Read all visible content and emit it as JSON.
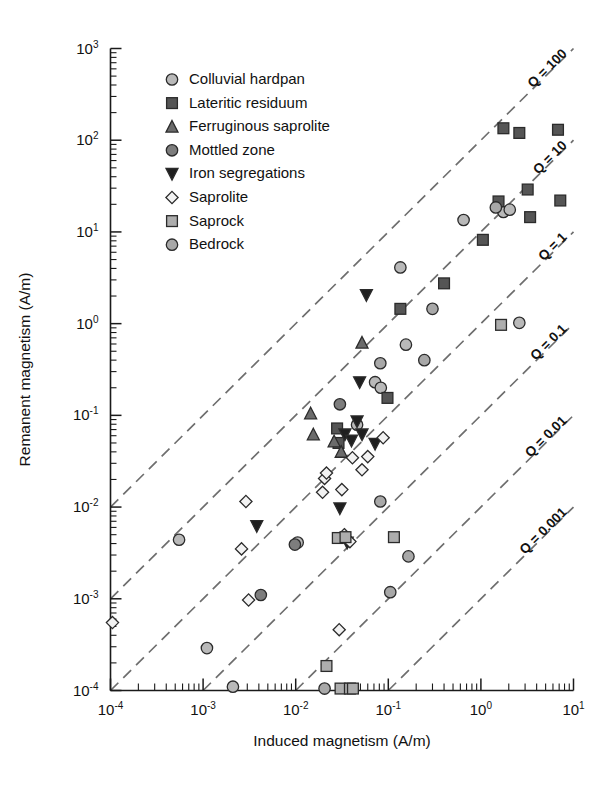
{
  "chart_data": {
    "type": "scatter",
    "title": "",
    "xlabel": "Induced magnetism (A/m)",
    "ylabel": "Remanent magnetism (A/m)",
    "xscale": "log",
    "yscale": "log",
    "xlim": [
      0.0001,
      10
    ],
    "ylim": [
      0.0001,
      1000
    ],
    "grid": false,
    "legend_position": "top-left",
    "xticks": [
      "10⁻⁴",
      "10⁻³",
      "10⁻²",
      "10⁻¹",
      "10⁰",
      "10¹"
    ],
    "xtick_values": [
      0.0001,
      0.001,
      0.01,
      0.1,
      1,
      10
    ],
    "ytick_values": [
      0.0001,
      0.001,
      0.01,
      0.1,
      1,
      10,
      100,
      1000
    ],
    "yticks": [
      "10⁻⁴",
      "10⁻³",
      "10⁻²",
      "10⁻¹",
      "10⁰",
      "10¹",
      "10²",
      "10³"
    ],
    "annotations": [
      {
        "text": "Q = 100",
        "q": 100
      },
      {
        "text": "Q = 10",
        "q": 10
      },
      {
        "text": "Q = 1",
        "q": 1
      },
      {
        "text": "Q = 0.1",
        "q": 0.1
      },
      {
        "text": "Q = 0.01",
        "q": 0.01
      },
      {
        "text": "Q = 0.001",
        "q": 0.001
      }
    ],
    "series": [
      {
        "name": "Colluvial hardpan",
        "marker": "circle",
        "fill": "#b9b9b9",
        "points": [
          [
            0.00055,
            0.0044
          ],
          [
            0.0011,
            0.00029
          ],
          [
            0.0021,
            0.00011
          ],
          [
            0.0105,
            0.0041
          ],
          [
            0.046,
            0.079
          ],
          [
            0.072,
            0.23
          ],
          [
            0.083,
            0.2
          ],
          [
            0.135,
            4.1
          ],
          [
            0.155,
            0.59
          ],
          [
            0.65,
            13.5
          ],
          [
            2.6,
            1.02
          ],
          [
            1.75,
            16.5
          ],
          [
            2.05,
            17.5
          ]
        ]
      },
      {
        "name": "Lateritic residuum",
        "marker": "square",
        "fill": "#555555",
        "points": [
          [
            0.028,
            0.072
          ],
          [
            0.029,
            0.05
          ],
          [
            0.098,
            0.155
          ],
          [
            0.135,
            1.45
          ],
          [
            0.4,
            2.75
          ],
          [
            1.05,
            8.2
          ],
          [
            1.55,
            21.5
          ],
          [
            1.75,
            135
          ],
          [
            2.6,
            120
          ],
          [
            3.2,
            29
          ],
          [
            3.4,
            14.5
          ],
          [
            6.8,
            130
          ],
          [
            7.2,
            22
          ]
        ]
      },
      {
        "name": "Ferruginous saprolite",
        "marker": "triangle-up",
        "fill": "#6b6b6b",
        "points": [
          [
            0.0145,
            0.105
          ],
          [
            0.0155,
            0.062
          ],
          [
            0.026,
            0.052
          ],
          [
            0.031,
            0.04
          ],
          [
            0.052,
            0.62
          ]
        ]
      },
      {
        "name": "Mottled zone",
        "marker": "circle-dark",
        "fill": "#7d7d7d",
        "points": [
          [
            0.0042,
            0.0011
          ],
          [
            0.0098,
            0.0039
          ],
          [
            0.03,
            0.132
          ]
        ]
      },
      {
        "name": "Iron segregations",
        "marker": "triangle-down",
        "fill": "#1f1f1f",
        "points": [
          [
            0.0038,
            0.0062
          ],
          [
            0.03,
            0.0097
          ],
          [
            0.036,
            0.0041
          ],
          [
            0.034,
            0.062
          ],
          [
            0.04,
            0.053
          ],
          [
            0.046,
            0.086
          ],
          [
            0.049,
            0.23
          ],
          [
            0.052,
            0.062
          ],
          [
            0.058,
            2.05
          ],
          [
            0.072,
            0.049
          ]
        ]
      },
      {
        "name": "Saprolite",
        "marker": "diamond",
        "fill": "#f2f2f2",
        "points": [
          [
            0.000105,
            0.00055
          ],
          [
            0.0029,
            0.0115
          ],
          [
            0.0026,
            0.0035
          ],
          [
            0.0031,
            0.00097
          ],
          [
            0.0205,
            0.0205
          ],
          [
            0.0215,
            0.0235
          ],
          [
            0.0195,
            0.0145
          ],
          [
            0.0295,
            0.00046
          ],
          [
            0.0315,
            0.0155
          ],
          [
            0.0335,
            0.005
          ],
          [
            0.041,
            0.0345
          ],
          [
            0.0385,
            0.0042
          ],
          [
            0.052,
            0.0255
          ],
          [
            0.06,
            0.0355
          ],
          [
            0.088,
            0.057
          ]
        ]
      },
      {
        "name": "Saprock",
        "marker": "square-light",
        "fill": "#adadad",
        "points": [
          [
            0.0215,
            0.000185
          ],
          [
            0.0285,
            0.0046
          ],
          [
            0.0345,
            0.0047
          ],
          [
            0.0305,
            0.000105
          ],
          [
            0.0385,
            0.000105
          ],
          [
            0.0415,
            0.000105
          ],
          [
            0.115,
            0.0047
          ],
          [
            1.65,
            0.97
          ]
        ]
      },
      {
        "name": "Bedrock",
        "marker": "circle-light",
        "fill": "#a8a8a8",
        "points": [
          [
            0.0205,
            0.000105
          ],
          [
            0.082,
            0.0115
          ],
          [
            0.105,
            0.00118
          ],
          [
            0.082,
            0.37
          ],
          [
            0.245,
            0.4
          ],
          [
            0.3,
            1.45
          ],
          [
            1.45,
            18.5
          ],
          [
            0.165,
            0.0029
          ]
        ]
      }
    ]
  },
  "legend": {
    "items": [
      {
        "label": "Colluvial hardpan",
        "marker": "circle"
      },
      {
        "label": "Lateritic residuum",
        "marker": "square"
      },
      {
        "label": "Ferruginous saprolite",
        "marker": "triangle-up"
      },
      {
        "label": "Mottled zone",
        "marker": "circle-dark"
      },
      {
        "label": "Iron segregations",
        "marker": "triangle-down"
      },
      {
        "label": "Saprolite",
        "marker": "diamond"
      },
      {
        "label": "Saprock",
        "marker": "square-light"
      },
      {
        "label": "Bedrock",
        "marker": "circle-light"
      }
    ]
  },
  "colors": {
    "axis": "#1a1a1a",
    "qline": "#6e6e6e",
    "background": "#ffffff"
  }
}
